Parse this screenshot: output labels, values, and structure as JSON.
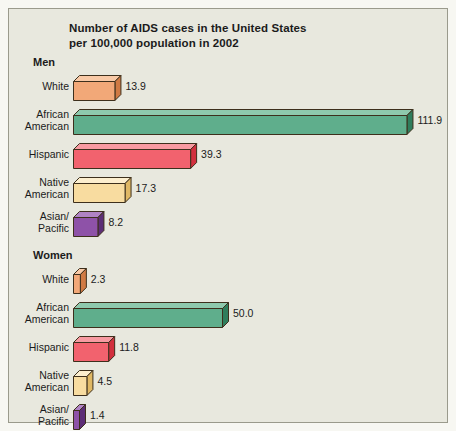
{
  "figure": {
    "background_color": "#e8e8de",
    "border_color": "#9a9a8c",
    "page_background": "#f7f7f2"
  },
  "title": {
    "line1": "Number of AIDS cases in the United States",
    "line2": "per 100,000 population in 2002"
  },
  "groups": [
    {
      "key": "men",
      "label": "Men"
    },
    {
      "key": "women",
      "label": "Women"
    }
  ],
  "chart_data": {
    "type": "bar",
    "orientation": "horizontal",
    "title": "Number of AIDS cases in the United States per 100,000 population in 2002",
    "xlabel": "",
    "ylabel": "",
    "xlim": [
      0,
      112
    ],
    "grid": false,
    "legend": "none",
    "units": "cases per 100,000 population",
    "year": 2002,
    "categories": [
      "White",
      "African American",
      "Hispanic",
      "Native American",
      "Asian/Pacific"
    ],
    "category_lines": [
      [
        "White",
        ""
      ],
      [
        "African",
        "American"
      ],
      [
        "Hispanic",
        ""
      ],
      [
        "Native",
        "American"
      ],
      [
        "Asian/",
        "Pacific"
      ]
    ],
    "series": [
      {
        "name": "Men",
        "values": [
          13.9,
          111.9,
          39.3,
          17.3,
          8.2
        ]
      },
      {
        "name": "Women",
        "values": [
          2.3,
          50.0,
          11.8,
          4.5,
          1.4
        ]
      }
    ],
    "value_labels": {
      "men": [
        "13.9",
        "111.9",
        "39.3",
        "17.3",
        "8.2"
      ],
      "women": [
        "2.3",
        "50.0",
        "11.8",
        "4.5",
        "1.4"
      ]
    },
    "bar_colors": {
      "White": "#f2a878",
      "African American": "#5fae8c",
      "Hispanic": "#f2626e",
      "Native American": "#f8dca0",
      "Asian/Pacific": "#8e52a8"
    },
    "bar_colors_top": {
      "White": "#f8c9a6",
      "African American": "#8ec9ad",
      "Hispanic": "#f79aa1",
      "Native American": "#fceece",
      "Asian/Pacific": "#b083c4"
    },
    "bar_colors_side": {
      "White": "#d07a44",
      "African American": "#2f7d5c",
      "Hispanic": "#d2303e",
      "Native American": "#e0b865",
      "Asian/Pacific": "#5d2e76"
    }
  }
}
